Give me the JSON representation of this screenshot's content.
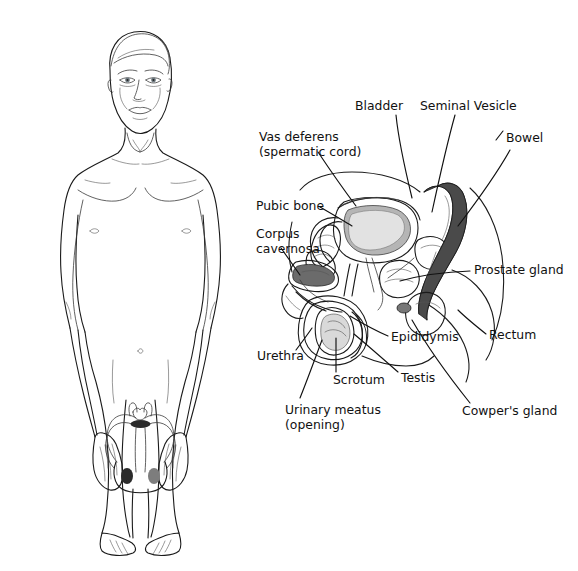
{
  "figure": {
    "background_color": "#ffffff",
    "line_color": "#111111",
    "width": 578,
    "height": 571
  },
  "body_figure": {
    "name": "male body front view",
    "parts": [
      "head",
      "neck",
      "torso",
      "left arm",
      "right arm",
      "left leg",
      "right leg",
      "navel",
      "nipples",
      "reproductive organs overlay"
    ]
  },
  "cross_section": {
    "name": "sagittal section of male pelvis",
    "structures": [
      "bladder",
      "seminal vesicle",
      "bowel",
      "prostate gland",
      "rectum",
      "cowpers gland",
      "vas deferens",
      "pubic bone",
      "corpus cavernosa",
      "urethra",
      "scrotum",
      "testis",
      "epididymis",
      "urinary meatus"
    ]
  },
  "labels": [
    {
      "id": "bladder",
      "text": "Bladder",
      "text2": "",
      "x": 355,
      "y": 110,
      "anchor": "start"
    },
    {
      "id": "seminal-vesicle",
      "text": "Seminal Vesicle",
      "text2": "",
      "x": 420,
      "y": 110,
      "anchor": "start"
    },
    {
      "id": "bowel",
      "text": "Bowel",
      "text2": "",
      "x": 506,
      "y": 142,
      "anchor": "start"
    },
    {
      "id": "vas-deferens",
      "text": "Vas deferens",
      "text2": "(spermatic cord)",
      "x": 259,
      "y": 141,
      "anchor": "start"
    },
    {
      "id": "pubic-bone",
      "text": "Pubic bone",
      "text2": "",
      "x": 256,
      "y": 210,
      "anchor": "start"
    },
    {
      "id": "corpus-cavernosa",
      "text": "Corpus",
      "text2": "cavernosa",
      "x": 256,
      "y": 238,
      "anchor": "start"
    },
    {
      "id": "prostate-gland",
      "text": "Prostate gland",
      "text2": "",
      "x": 474,
      "y": 274,
      "anchor": "start"
    },
    {
      "id": "rectum",
      "text": "Rectum",
      "text2": "",
      "x": 489,
      "y": 339,
      "anchor": "start"
    },
    {
      "id": "epididymis",
      "text": "Epididymis",
      "text2": "",
      "x": 391,
      "y": 341,
      "anchor": "start"
    },
    {
      "id": "urethra",
      "text": "Urethra",
      "text2": "",
      "x": 257,
      "y": 360,
      "anchor": "start"
    },
    {
      "id": "scrotum",
      "text": "Scrotum",
      "text2": "",
      "x": 333,
      "y": 384,
      "anchor": "start"
    },
    {
      "id": "testis",
      "text": "Testis",
      "text2": "",
      "x": 401,
      "y": 382,
      "anchor": "start"
    },
    {
      "id": "urinary-meatus",
      "text": "Urinary meatus",
      "text2": "(opening)",
      "x": 285,
      "y": 414,
      "anchor": "start"
    },
    {
      "id": "cowpers-gland",
      "text": "Cowper's gland",
      "text2": "",
      "x": 462,
      "y": 415,
      "anchor": "start"
    }
  ]
}
